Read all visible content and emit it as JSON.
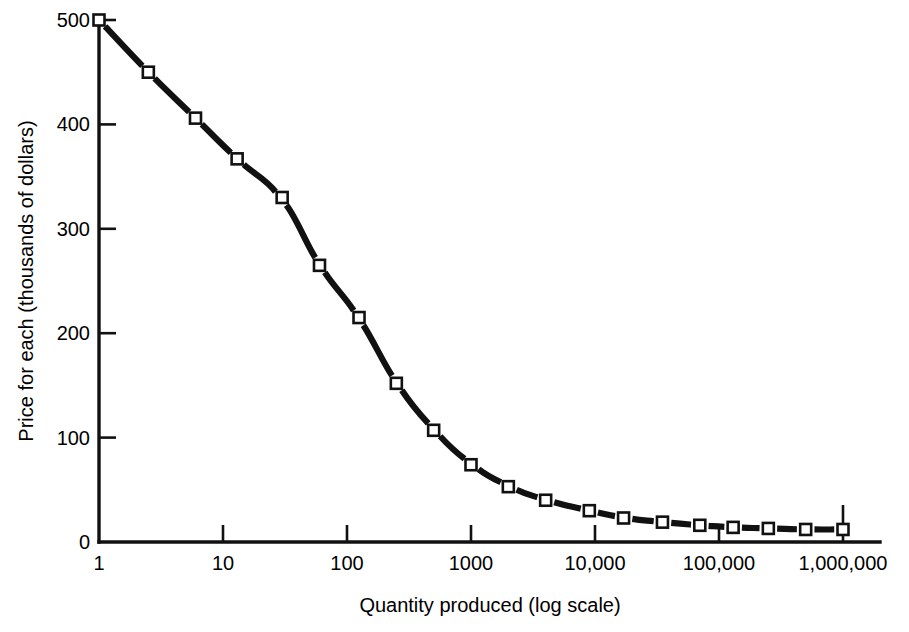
{
  "figure": {
    "background_color": "#ffffff",
    "ink_color": "#111111",
    "marker_fill_color": "#ffffff"
  },
  "chart_data": {
    "type": "line",
    "title": "",
    "subtitle": "",
    "xlabel": "Quantity produced (log scale)",
    "ylabel": "Price for each  (thousands of dollars)",
    "x_scale": "log",
    "y_scale": "linear",
    "xlim": [
      1,
      1000000
    ],
    "ylim": [
      0,
      500
    ],
    "grid": false,
    "legend": null,
    "legend_position": "none",
    "x_tick_labels": [
      "1",
      "10",
      "100",
      "1000",
      "10,000",
      "100,000",
      "1,000,000"
    ],
    "x_tick_values": [
      1,
      10,
      100,
      1000,
      10000,
      100000,
      1000000
    ],
    "y_tick_labels": [
      "0",
      "100",
      "200",
      "300",
      "400",
      "500"
    ],
    "y_tick_values": [
      0,
      100,
      200,
      300,
      400,
      500
    ],
    "marker_style": "open-square",
    "line_style": "solid",
    "series": [
      {
        "name": "Price for each",
        "x": [
          1,
          2.5,
          6,
          13,
          30,
          60,
          125,
          250,
          500,
          1000,
          2000,
          4000,
          9000,
          17000,
          35000,
          70000,
          130000,
          250000,
          500000,
          1000000
        ],
        "values": [
          500,
          450,
          406,
          367,
          330,
          265,
          215,
          152,
          107,
          74,
          53,
          40,
          30,
          23,
          19,
          16,
          14,
          13,
          12,
          12
        ]
      }
    ],
    "annotations": []
  }
}
